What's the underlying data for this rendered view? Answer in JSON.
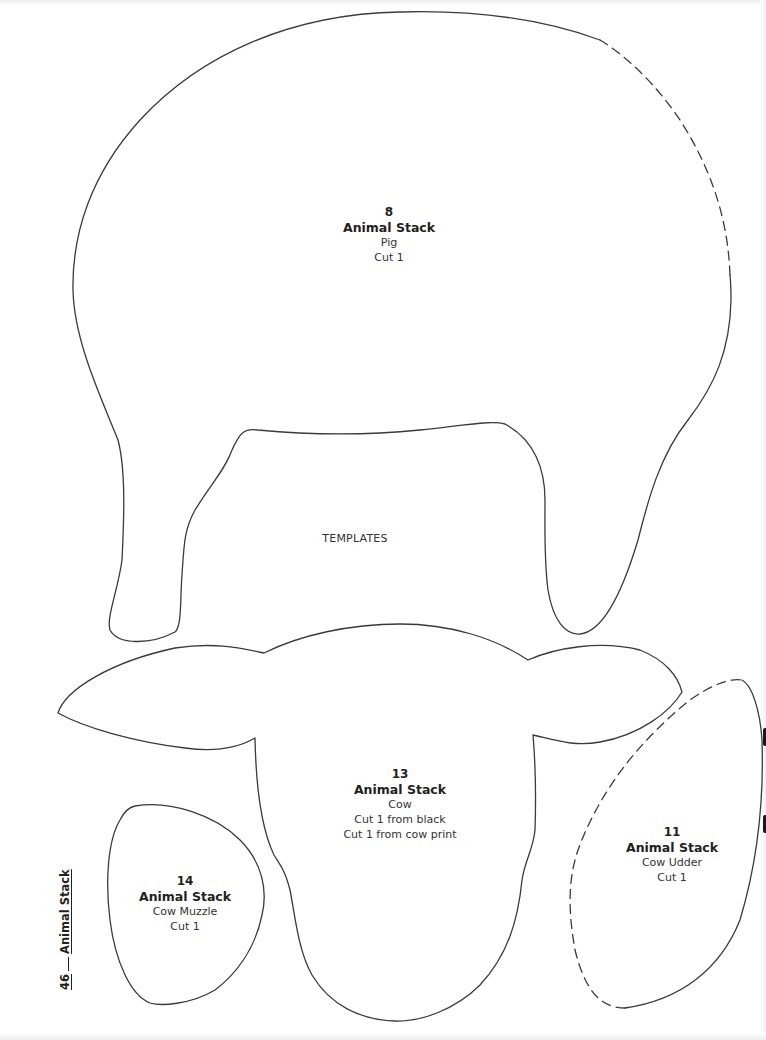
{
  "page": {
    "page_number": "46",
    "section_title": "Animal Stack",
    "center_label": "TEMPLATES",
    "outline_color": "#3a3a3a",
    "background": "#ffffff"
  },
  "templates": [
    {
      "id": "pig",
      "number": "8",
      "title": "Animal Stack",
      "name": "Pig",
      "cut_lines": [
        "Cut 1"
      ],
      "edge_style": "solid with dashed placement edge (upper right)"
    },
    {
      "id": "cow-head",
      "number": "13",
      "title": "Animal Stack",
      "name": "Cow",
      "cut_lines": [
        "Cut 1 from black",
        "Cut 1 from cow print"
      ],
      "edge_style": "solid"
    },
    {
      "id": "cow-muzzle",
      "number": "14",
      "title": "Animal Stack",
      "name": "Cow Muzzle",
      "cut_lines": [
        "Cut 1"
      ],
      "edge_style": "solid"
    },
    {
      "id": "cow-udder",
      "number": "11",
      "title": "Animal Stack",
      "name": "Cow Udder",
      "cut_lines": [
        "Cut 1"
      ],
      "edge_style": "solid with dashed placement edge (left side)"
    }
  ]
}
